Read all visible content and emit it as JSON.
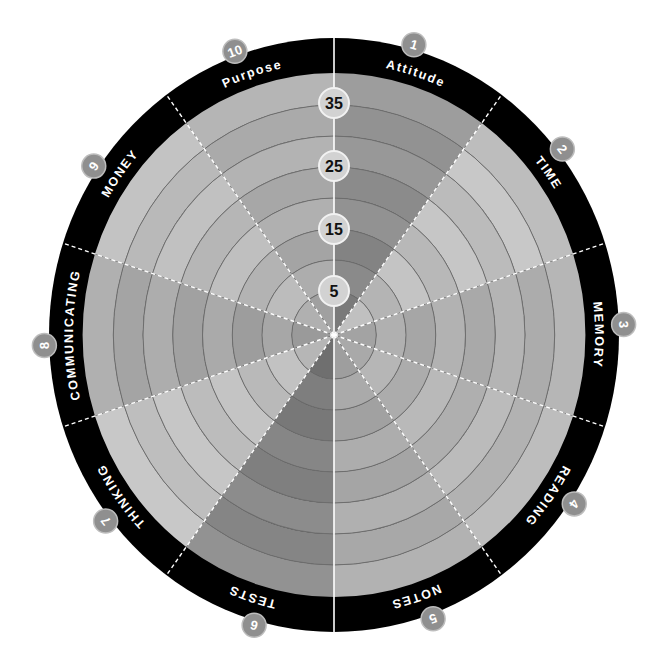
{
  "wheel": {
    "title": "Success wheel",
    "center": [
      334,
      335
    ],
    "ring_radii": [
      44,
      75,
      106,
      137,
      168,
      199,
      230,
      262
    ],
    "outer_band": {
      "inner_r": 262,
      "outer_rx": 285,
      "outer_ry": 297,
      "color": "#000000"
    },
    "scale": [
      {
        "label": "35",
        "r": 232
      },
      {
        "label": "25",
        "r": 169
      },
      {
        "label": "15",
        "r": 106
      },
      {
        "label": "5",
        "r": 44
      }
    ],
    "sectors": [
      {
        "number": "1",
        "label": "Attitude",
        "shades": [
          "#7a7a7a",
          "#8a8a8a",
          "#838383",
          "#929292",
          "#8b8b8b",
          "#989898",
          "#929292",
          "#9d9d9d"
        ]
      },
      {
        "number": "2",
        "label": "TIME",
        "shades": [
          "#c0c0c0",
          "#b4b4b4",
          "#c4c4c4",
          "#b8b8b8",
          "#c6c6c6",
          "#bbbbbb",
          "#c8c8c8",
          "#bdbdbd"
        ]
      },
      {
        "number": "3",
        "label": "MEMORY",
        "shades": [
          "#a3a3a3",
          "#b0b0b0",
          "#a6a6a6",
          "#b2b2b2",
          "#a9a9a9",
          "#b4b4b4",
          "#acacac",
          "#b6b6b6"
        ]
      },
      {
        "number": "4",
        "label": "READING",
        "shades": [
          "#a9a9a9",
          "#b6b6b6",
          "#acacac",
          "#b9b9b9",
          "#afafaf",
          "#bbbbbb",
          "#b2b2b2",
          "#bdbdbd"
        ]
      },
      {
        "number": "5",
        "label": "NOTES",
        "shades": [
          "#9e9e9e",
          "#aaaaaa",
          "#a1a1a1",
          "#adadad",
          "#a5a5a5",
          "#b0b0b0",
          "#a8a8a8",
          "#b2b2b2"
        ]
      },
      {
        "number": "6",
        "label": "TESTS",
        "shades": [
          "#6f6f6f",
          "#7e7e7e",
          "#787878",
          "#868686",
          "#7f7f7f",
          "#8c8c8c",
          "#858585",
          "#929292"
        ]
      },
      {
        "number": "7",
        "label": "THINKING",
        "shades": [
          "#b6b6b6",
          "#c2c2c2",
          "#b9b9b9",
          "#c4c4c4",
          "#bcbcbc",
          "#c6c6c6",
          "#bebebe",
          "#c8c8c8"
        ]
      },
      {
        "number": "8",
        "label": "COMMUNICATING",
        "shades": [
          "#9a9a9a",
          "#a7a7a7",
          "#9d9d9d",
          "#aaaaaa",
          "#a1a1a1",
          "#adadad",
          "#a4a4a4",
          "#b0b0b0"
        ]
      },
      {
        "number": "9",
        "label": "MONEY",
        "shades": [
          "#b0b0b0",
          "#bcbcbc",
          "#b3b3b3",
          "#bfbfbf",
          "#b6b6b6",
          "#c1c1c1",
          "#b9b9b9",
          "#c3c3c3"
        ]
      },
      {
        "number": "10",
        "label": "Purpose",
        "shades": [
          "#a0a0a0",
          "#adadad",
          "#a4a4a4",
          "#b0b0b0",
          "#a7a7a7",
          "#b3b3b3",
          "#aaaaaa",
          "#b5b5b5"
        ]
      }
    ],
    "colors": {
      "ring_line": "#6e6e6e",
      "divider": "#ffffff",
      "badge_fill": "#8f8f8f",
      "badge_border": "#bdbdbd",
      "scale_fill": "#d2d2d2",
      "scale_border": "#f2f2f2"
    }
  }
}
